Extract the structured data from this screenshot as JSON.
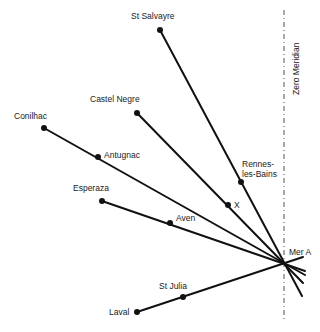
{
  "diagram": {
    "meridian": {
      "label": "Zero Meridian",
      "x": 284,
      "y_start": 10,
      "y_end": 322
    },
    "center": {
      "name": "Mer A",
      "x": 285,
      "y": 263,
      "label_x": 289,
      "label_y": 255
    },
    "points": [
      {
        "name": "St Salvayre",
        "x": 160,
        "y": 30,
        "label": "St Salvayre",
        "lx": 131,
        "ly": 19
      },
      {
        "name": "Castel Negre",
        "x": 137,
        "y": 113,
        "label": "Castel Negre",
        "lx": 90,
        "ly": 102
      },
      {
        "name": "Conilhac",
        "x": 44,
        "y": 128,
        "label": "Conilhac",
        "lx": 14,
        "ly": 119
      },
      {
        "name": "Antugnac",
        "x": 98,
        "y": 157,
        "label": "Antugnac",
        "lx": 104,
        "ly": 158
      },
      {
        "name": "Rennes-les-Bains",
        "x": 241,
        "y": 182,
        "label_line1": "Rennes-",
        "label_line2": "les-Bains",
        "lx": 242,
        "ly": 167
      },
      {
        "name": "X",
        "x": 228,
        "y": 205,
        "label": "X",
        "lx": 234,
        "ly": 208
      },
      {
        "name": "Esperaza",
        "x": 102,
        "y": 201,
        "label": "Esperaza",
        "lx": 73,
        "ly": 191
      },
      {
        "name": "Aven",
        "x": 170,
        "y": 223,
        "label": "Aven",
        "lx": 176,
        "ly": 221
      },
      {
        "name": "St Julia",
        "x": 183,
        "y": 297,
        "label": "St Julia",
        "lx": 159,
        "ly": 289
      },
      {
        "name": "Laval",
        "x": 137,
        "y": 312,
        "label": "Laval",
        "lx": 109,
        "ly": 315
      }
    ],
    "alignments": [
      {
        "name": "St Salvayre - Rennes-les-Bains - Mer A",
        "from": [
          160,
          30
        ],
        "to": [
          302,
          296
        ]
      },
      {
        "name": "Castel Negre - X - Mer A",
        "from": [
          137,
          113
        ],
        "to": [
          303,
          283
        ]
      },
      {
        "name": "Conilhac - Antugnac - Mer A",
        "from": [
          44,
          128
        ],
        "to": [
          305,
          275
        ]
      },
      {
        "name": "Esperaza - Aven - Mer A",
        "from": [
          102,
          201
        ],
        "to": [
          305,
          271
        ]
      },
      {
        "name": "Laval - St Julia - Mer A",
        "from": [
          137,
          312
        ],
        "to": [
          303,
          257
        ]
      }
    ],
    "caption": "Zero Meridian alignments"
  }
}
